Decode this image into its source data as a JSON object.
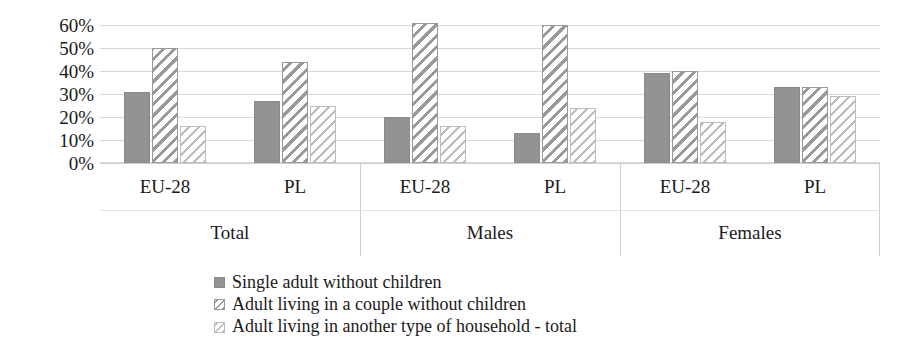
{
  "chart_data": {
    "type": "bar",
    "title": "",
    "subtitle": "",
    "xlabel": "",
    "ylabel": "",
    "ylim": [
      0,
      60
    ],
    "ytick_values": [
      0,
      10,
      20,
      30,
      40,
      50,
      60
    ],
    "ytick_labels": [
      "0%",
      "10%",
      "20%",
      "30%",
      "40%",
      "50%",
      "60%"
    ],
    "grid": true,
    "legend_position": "bottom",
    "group_labels": [
      "Total",
      "Males",
      "Females"
    ],
    "categories": [
      "EU-28",
      "PL",
      "EU-28",
      "PL",
      "EU-28",
      "PL"
    ],
    "series": [
      {
        "name": "Single adult without children",
        "pattern": "solid",
        "color": "#939393",
        "values": [
          31,
          27,
          20,
          13,
          39,
          33
        ]
      },
      {
        "name": "Adult living in a couple without children",
        "pattern": "diagonal-stripe",
        "color": "#9a9a9a",
        "values": [
          50,
          44,
          61,
          60,
          40,
          33
        ]
      },
      {
        "name": "Adult living in another type of household - total",
        "pattern": "light-diagonal-stripe",
        "color": "#bdbdbd",
        "values": [
          16,
          25,
          16,
          24,
          18,
          29
        ]
      }
    ],
    "groups": [
      {
        "label": "Total",
        "regions": [
          {
            "label": "EU-28",
            "values": [
              31,
              50,
              16
            ]
          },
          {
            "label": "PL",
            "values": [
              27,
              44,
              25
            ]
          }
        ]
      },
      {
        "label": "Males",
        "regions": [
          {
            "label": "EU-28",
            "values": [
              20,
              61,
              16
            ]
          },
          {
            "label": "PL",
            "values": [
              13,
              60,
              24
            ]
          }
        ]
      },
      {
        "label": "Females",
        "regions": [
          {
            "label": "EU-28",
            "values": [
              39,
              40,
              18
            ]
          },
          {
            "label": "PL",
            "values": [
              33,
              33,
              29
            ]
          }
        ]
      }
    ]
  }
}
